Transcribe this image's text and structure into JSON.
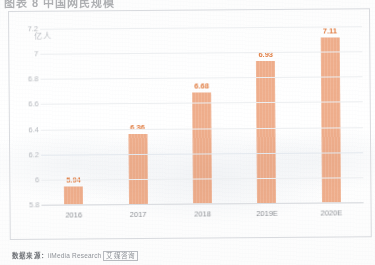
{
  "header": {
    "cropped_title": "图表 8 中国网民规模"
  },
  "chart_data": {
    "type": "bar",
    "title": "",
    "subtitle": "",
    "xlabel": "",
    "ylabel": "亿人",
    "unit": "亿人",
    "categories": [
      "2016",
      "2017",
      "2018",
      "2019E",
      "2020E"
    ],
    "values": [
      5.94,
      6.36,
      6.68,
      6.93,
      7.11
    ],
    "value_labels": [
      "5.94",
      "6.36",
      "6.68",
      "6.93",
      "7.11"
    ],
    "ylim": [
      5.8,
      7.2
    ],
    "yticks": [
      7.2,
      7,
      6.8,
      6.6,
      6.4,
      6.2,
      6,
      5.8
    ],
    "ytick_labels": [
      "7.2",
      "7",
      "6.8",
      "6.6",
      "6.4",
      "6.2",
      "6",
      "5.8"
    ],
    "grid": true,
    "legend": null,
    "series": [
      {
        "name": "规模",
        "values": [
          5.94,
          6.36,
          6.68,
          6.93,
          7.11
        ]
      }
    ],
    "colors": {
      "bar": "#e2763f",
      "bar_light": "#ec8a55",
      "value_label": "#e07a3e",
      "axis_text": "#8e9196",
      "gridline": "#eceef0",
      "frame": "#d8dade"
    }
  },
  "footer": {
    "source_prefix": "数据来源：",
    "source_name": "iiMedia Research",
    "source_tag": "艾媒咨询"
  }
}
